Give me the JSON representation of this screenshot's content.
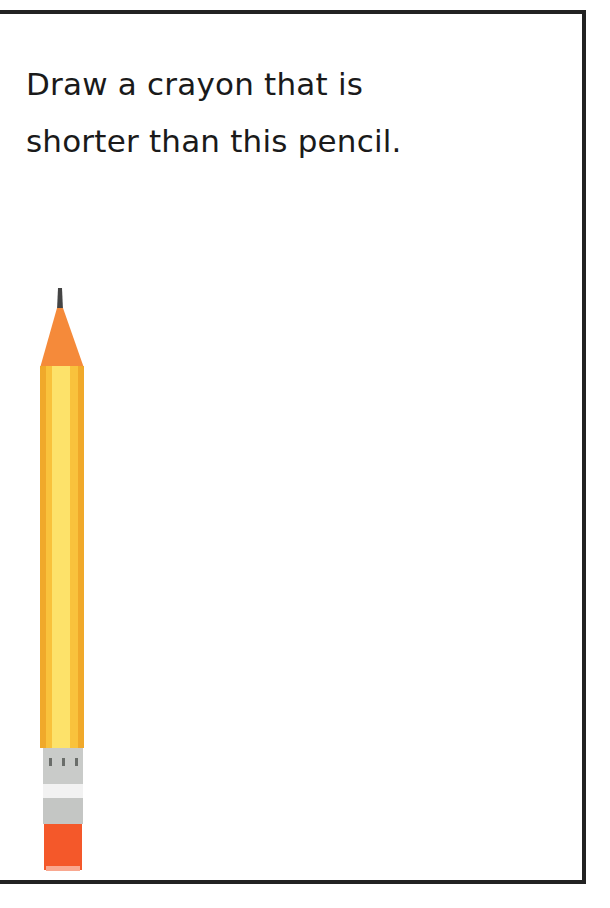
{
  "worksheet": {
    "prompt_line1": "Draw a crayon that is",
    "prompt_line2": "shorter than this pencil.",
    "image": "pencil-icon",
    "colors": {
      "border": "#222222",
      "pencil_body": "#f9c23c",
      "pencil_tip": "#f58a3a",
      "ferrule": "#c9cbc9",
      "eraser": "#f4582a"
    }
  }
}
